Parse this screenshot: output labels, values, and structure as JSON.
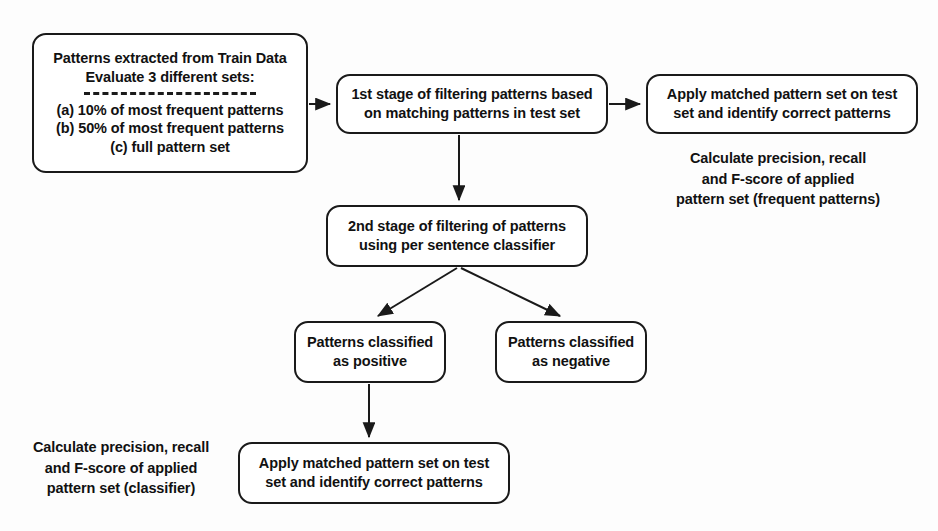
{
  "diagram": {
    "stroke_color": "#1a1a1a",
    "text_color": "#111111",
    "background": "#fdfdfd"
  },
  "nodes": {
    "source": {
      "lines": [
        "Patterns extracted  from Train Data",
        "Evaluate 3 different sets:"
      ],
      "options": [
        "(a) 10% of most frequent patterns",
        "(b) 50% of most frequent patterns",
        "(c) full pattern set"
      ]
    },
    "stage1": {
      "lines": [
        "1st stage of filtering patterns based",
        "on matching patterns in test set"
      ]
    },
    "apply_top": {
      "lines": [
        "Apply matched pattern set on test",
        "set and identify correct patterns"
      ]
    },
    "stage2": {
      "lines": [
        "2nd stage of filtering of patterns",
        "using per sentence classifier"
      ]
    },
    "positive": {
      "lines": [
        "Patterns classified",
        "as positive"
      ]
    },
    "negative": {
      "lines": [
        "Patterns classified",
        "as negative"
      ]
    },
    "apply_bottom": {
      "lines": [
        "Apply matched pattern set on test",
        "set and identify correct patterns"
      ]
    }
  },
  "annotations": {
    "frequent": {
      "lines": [
        "Calculate precision, recall",
        "and F-score of applied",
        "pattern set (frequent patterns)"
      ]
    },
    "classifier": {
      "lines": [
        "Calculate precision, recall",
        "and F-score of applied",
        "pattern set (classifier)"
      ]
    }
  },
  "edges": [
    {
      "name": "source-to-stage1",
      "from": "source",
      "to": "stage1",
      "direction": "right"
    },
    {
      "name": "stage1-to-apply-top",
      "from": "stage1",
      "to": "apply_top",
      "direction": "right"
    },
    {
      "name": "stage1-to-stage2",
      "from": "stage1",
      "to": "stage2",
      "direction": "down"
    },
    {
      "name": "stage2-to-positive",
      "from": "stage2",
      "to": "positive",
      "direction": "down-left"
    },
    {
      "name": "stage2-to-negative",
      "from": "stage2",
      "to": "negative",
      "direction": "down-right"
    },
    {
      "name": "positive-to-apply-bottom",
      "from": "positive",
      "to": "apply_bottom",
      "direction": "down"
    }
  ]
}
